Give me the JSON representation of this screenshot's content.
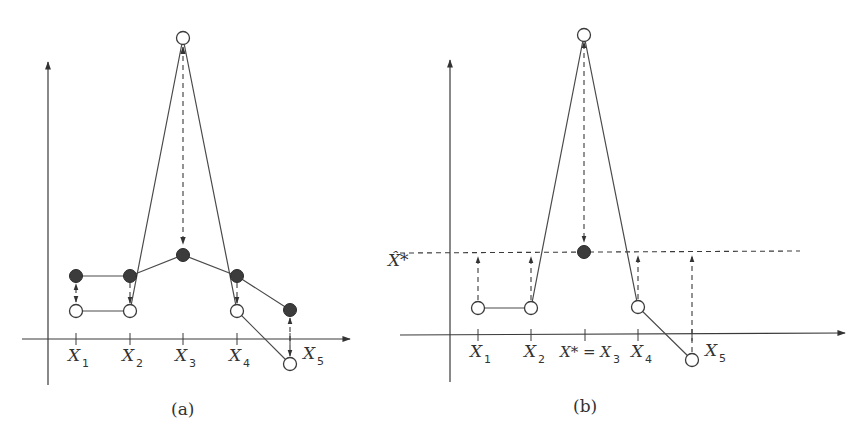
{
  "panels": [
    {
      "id": "a",
      "caption": "(a)",
      "x_labels": [
        {
          "base": "X",
          "sub": "1"
        },
        {
          "base": "X",
          "sub": "2"
        },
        {
          "base": "X",
          "sub": "3"
        },
        {
          "base": "X",
          "sub": "4"
        },
        {
          "base": "X",
          "sub": "5"
        }
      ],
      "open_points_desc": "original values, connected by solid polyline with spike at X3",
      "filled_points_desc": "smoothed values, connected by solid polyline"
    },
    {
      "id": "b",
      "caption": "(b)",
      "x_labels": [
        {
          "base": "X",
          "sub": "1"
        },
        {
          "base": "X",
          "sub": "2"
        },
        {
          "base": "X* = X",
          "sub": "3"
        },
        {
          "base": "X",
          "sub": "4"
        },
        {
          "base": "X",
          "sub": "5"
        }
      ],
      "y_label": "X̂*",
      "open_points_desc": "original values with dashed arrows up/down to horizontal level X̂*",
      "filled_points_desc": "single filled point at X3 on dashed level line"
    }
  ],
  "colors": {
    "ink": "#3a3a3a",
    "fill": "#3c3c3c",
    "background": "#ffffff"
  }
}
